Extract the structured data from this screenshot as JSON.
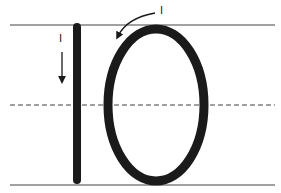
{
  "diagram": {
    "digits": [
      "1",
      "0"
    ],
    "guides": {
      "top_line": "solid",
      "mid_line": "dashed",
      "bottom_line": "solid"
    },
    "stroke_labels": {
      "digit_one_stroke": "I",
      "digit_zero_stroke": "I"
    },
    "colors": {
      "ink": "#1a1a1a",
      "guide_line": "#444444",
      "background": "#ffffff"
    }
  }
}
